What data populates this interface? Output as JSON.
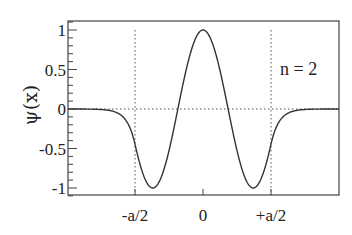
{
  "chart_data": {
    "type": "line",
    "title": "",
    "xlabel": "",
    "ylabel": "ψ(x)",
    "annotation": "n = 2",
    "xlim": [
      -1.995,
      2.0
    ],
    "ylim": [
      -1.11,
      1.11
    ],
    "x_ticks": [
      {
        "value": -1,
        "label": "-a/2"
      },
      {
        "value": 0,
        "label": "0"
      },
      {
        "value": 1,
        "label": "+a/2"
      }
    ],
    "y_ticks": [
      {
        "value": 1,
        "label": "1"
      },
      {
        "value": 0.5,
        "label": "0.5"
      },
      {
        "value": 0,
        "label": "0"
      },
      {
        "value": -0.5,
        "label": "-0.5"
      },
      {
        "value": -1,
        "label": "-1"
      }
    ],
    "y_minor_step": 0.1,
    "x_unit_note": "x in units of a/2",
    "reference_lines": {
      "horizontal_dotted": [
        0
      ],
      "vertical_dotted": [
        -1,
        1
      ]
    },
    "series": [
      {
        "name": "psi_n2",
        "style": "solid",
        "color": "#333333",
        "points": [
          {
            "x": -1.99,
            "y": -0.0
          },
          {
            "x": -1.6,
            "y": -0.003
          },
          {
            "x": -1.4,
            "y": -0.015
          },
          {
            "x": -1.3,
            "y": -0.035
          },
          {
            "x": -1.2,
            "y": -0.08
          },
          {
            "x": -1.1,
            "y": -0.19
          },
          {
            "x": -1.0,
            "y": -0.45
          },
          {
            "x": -0.9,
            "y": -0.77
          },
          {
            "x": -0.74,
            "y": -1.0
          },
          {
            "x": -0.6,
            "y": -0.85
          },
          {
            "x": -0.37,
            "y": 0.0
          },
          {
            "x": -0.2,
            "y": 0.66
          },
          {
            "x": 0.0,
            "y": 1.0
          },
          {
            "x": 0.2,
            "y": 0.66
          },
          {
            "x": 0.37,
            "y": 0.0
          },
          {
            "x": 0.6,
            "y": -0.85
          },
          {
            "x": 0.74,
            "y": -1.0
          },
          {
            "x": 0.9,
            "y": -0.77
          },
          {
            "x": 1.0,
            "y": -0.45
          },
          {
            "x": 1.1,
            "y": -0.19
          },
          {
            "x": 1.2,
            "y": -0.08
          },
          {
            "x": 1.3,
            "y": -0.035
          },
          {
            "x": 1.4,
            "y": -0.015
          },
          {
            "x": 1.6,
            "y": -0.003
          },
          {
            "x": 2.0,
            "y": 0.0
          }
        ],
        "model": {
          "inside": "cos(4.25*x)",
          "outside": "cos(4.25)*exp(-8.5*(|x|-1))"
        }
      }
    ],
    "grid": false,
    "legend": null
  },
  "layout": {
    "frame": {
      "left": 68,
      "top": 21,
      "right": 339,
      "bottom": 195
    },
    "x_zero_px": 203,
    "x_unit_px": 68,
    "y_zero_px": 109,
    "y_unit_px": 79
  },
  "colors": {
    "line": "#333333",
    "frame": "#444444",
    "dotted": "#555555",
    "background": "#ffffff"
  }
}
